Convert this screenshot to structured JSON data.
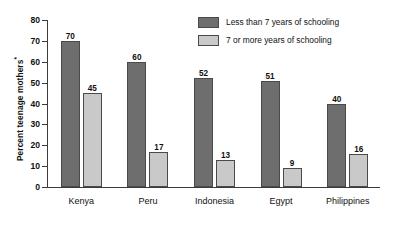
{
  "chart_data": {
    "type": "bar",
    "title": "",
    "xlabel": "",
    "ylabel": "Percent teenage mothers",
    "ylabel_superscript": "*",
    "categories": [
      "Kenya",
      "Peru",
      "Indonesia",
      "Egypt",
      "Philippines"
    ],
    "series": [
      {
        "name": "Less than 7 years of schooling",
        "color": "#6e6e6e",
        "values": [
          70,
          60,
          52,
          51,
          40
        ]
      },
      {
        "name": "7 or more years of schooling",
        "color": "#c9c9c9",
        "values": [
          45,
          17,
          13,
          9,
          16
        ]
      }
    ],
    "ylim": [
      0,
      80
    ],
    "yticks": [
      0,
      10,
      20,
      30,
      40,
      50,
      60,
      70,
      80
    ],
    "grid": false,
    "legend_position": "top-right"
  },
  "legend": {
    "items": [
      {
        "label": "Less than 7 years of schooling"
      },
      {
        "label": "7 or more years of schooling"
      }
    ]
  },
  "footnote": {
    "text": ""
  }
}
